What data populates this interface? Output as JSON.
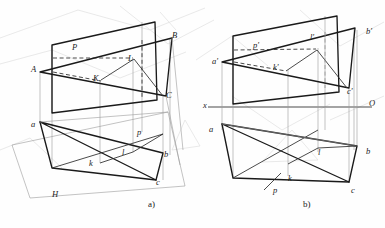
{
  "figure": {
    "ink_color": "#1a1a1a",
    "thin_color": "#8c8c8c",
    "ghost_color": "#dcdcdc",
    "captions": [
      {
        "id": "caption-a",
        "text": "a)",
        "x": 148,
        "y": 205
      },
      {
        "id": "caption-b",
        "text": "b)",
        "x": 303,
        "y": 205
      }
    ]
  },
  "pictorial": {
    "name": "pictorial-view",
    "labels": [
      {
        "id": "label-A",
        "text": "A",
        "x": 31,
        "y": 65
      },
      {
        "id": "label-B",
        "text": "B",
        "x": 172,
        "y": 31
      },
      {
        "id": "label-C",
        "text": "C",
        "x": 166,
        "y": 91
      },
      {
        "id": "label-P",
        "text": "P",
        "x": 72,
        "y": 43
      },
      {
        "id": "label-K",
        "text": "K",
        "x": 93,
        "y": 74
      },
      {
        "id": "label-L",
        "text": "L",
        "x": 128,
        "y": 54
      },
      {
        "id": "label-a",
        "text": "a",
        "x": 31,
        "y": 120
      },
      {
        "id": "label-b",
        "text": "b",
        "x": 164,
        "y": 150
      },
      {
        "id": "label-c",
        "text": "c",
        "x": 156,
        "y": 178
      },
      {
        "id": "label-k",
        "text": "k",
        "x": 89,
        "y": 159
      },
      {
        "id": "label-l",
        "text": "l",
        "x": 122,
        "y": 148
      },
      {
        "id": "label-p",
        "text": "p",
        "x": 137,
        "y": 128
      },
      {
        "id": "label-H",
        "text": "H",
        "x": 52,
        "y": 190
      }
    ]
  },
  "orthographic": {
    "name": "monge-projection",
    "labels": [
      {
        "id": "label-a-prime",
        "text": "a'",
        "x": 212,
        "y": 57
      },
      {
        "id": "label-b-prime",
        "text": "b'",
        "x": 366,
        "y": 27
      },
      {
        "id": "label-c-prime",
        "text": "c'",
        "x": 347,
        "y": 87
      },
      {
        "id": "label-p-prime",
        "text": "p'",
        "x": 253,
        "y": 41
      },
      {
        "id": "label-k-prime",
        "text": "k'",
        "x": 273,
        "y": 63
      },
      {
        "id": "label-l-prime",
        "text": "l'",
        "x": 310,
        "y": 33
      },
      {
        "id": "label-x-axis",
        "text": "x",
        "x": 203,
        "y": 105
      },
      {
        "id": "label-O-origin",
        "text": "O",
        "x": 369,
        "y": 101
      },
      {
        "id": "label-a",
        "text": "a",
        "x": 209,
        "y": 125
      },
      {
        "id": "label-b",
        "text": "b",
        "x": 366,
        "y": 147
      },
      {
        "id": "label-c",
        "text": "c",
        "x": 351,
        "y": 186
      },
      {
        "id": "label-k",
        "text": "k",
        "x": 288,
        "y": 174
      },
      {
        "id": "label-l",
        "text": "l",
        "x": 318,
        "y": 148
      },
      {
        "id": "label-p",
        "text": "p",
        "x": 273,
        "y": 186
      }
    ]
  }
}
